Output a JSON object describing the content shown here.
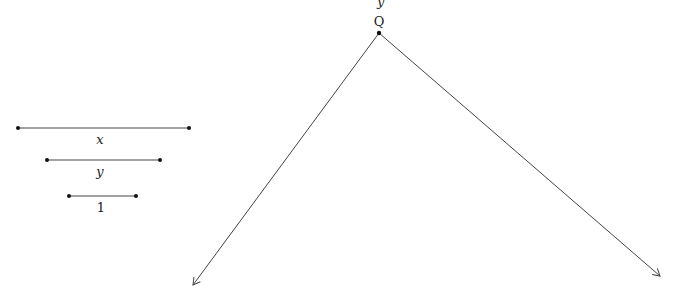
{
  "diagram": {
    "top_partial_label": "y",
    "vertex_label": "Q",
    "segments": [
      {
        "label": "x",
        "italic": true,
        "x1": 18,
        "x2": 189,
        "y": 128
      },
      {
        "label": "y",
        "italic": true,
        "x1": 47,
        "x2": 160,
        "y": 160
      },
      {
        "label": "1",
        "italic": false,
        "x1": 69,
        "x2": 136,
        "y": 196
      }
    ],
    "vertex": {
      "x": 379,
      "y": 33
    },
    "rays": [
      {
        "name": "left-ray",
        "x2": 193,
        "y2": 285
      },
      {
        "name": "right-ray",
        "x2": 660,
        "y2": 276
      }
    ],
    "colors": {
      "line": "#444444",
      "point": "#111111"
    }
  }
}
